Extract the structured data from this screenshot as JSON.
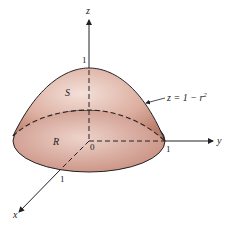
{
  "figure": {
    "axes": {
      "x_label": "x",
      "y_label": "y",
      "z_label": "z"
    },
    "ticks": {
      "z_one": "1",
      "y_one": "1",
      "x_one": "1",
      "origin": "0"
    },
    "regions": {
      "surface_label": "S",
      "base_label": "R"
    },
    "equation": {
      "lhs": "z = 1 − r",
      "exponent": "2"
    },
    "colors": {
      "fill_light": "#f0d8d0",
      "fill_dark": "#c58a7a",
      "stroke": "#222222"
    }
  }
}
